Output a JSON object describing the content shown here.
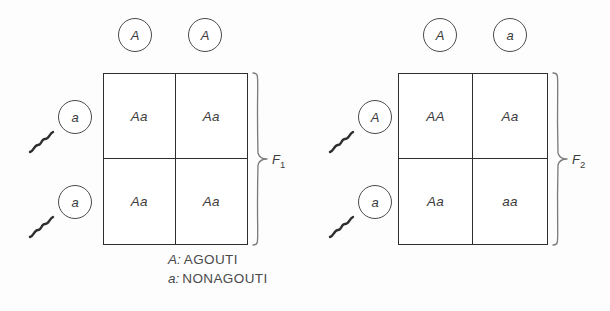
{
  "figure": {
    "background_color": "#fdfdfd",
    "line_color": "#2e2e2e"
  },
  "panels": [
    {
      "id": "f1-cross",
      "brace_label": "F",
      "brace_sub": "1",
      "top_gametes": [
        {
          "allele": "A",
          "type": "egg"
        },
        {
          "allele": "A",
          "type": "egg"
        }
      ],
      "side_gametes": [
        {
          "allele": "a",
          "type": "sperm"
        },
        {
          "allele": "a",
          "type": "sperm"
        }
      ],
      "cells": [
        {
          "genotype": "Aa"
        },
        {
          "genotype": "Aa"
        },
        {
          "genotype": "Aa"
        },
        {
          "genotype": "Aa"
        }
      ]
    },
    {
      "id": "f2-cross",
      "brace_label": "F",
      "brace_sub": "2",
      "top_gametes": [
        {
          "allele": "A",
          "type": "egg"
        },
        {
          "allele": "a",
          "type": "egg"
        }
      ],
      "side_gametes": [
        {
          "allele": "A",
          "type": "sperm"
        },
        {
          "allele": "a",
          "type": "sperm"
        }
      ],
      "cells": [
        {
          "genotype": "AA"
        },
        {
          "genotype": "Aa"
        },
        {
          "genotype": "Aa"
        },
        {
          "genotype": "aa"
        }
      ]
    }
  ],
  "legend": {
    "rows": [
      {
        "key": "A:",
        "value": "AGOUTI"
      },
      {
        "key": "a:",
        "value": "NONAGOUTI"
      }
    ]
  }
}
